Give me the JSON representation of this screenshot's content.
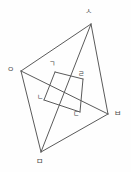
{
  "figure": {
    "type": "geometry-diagram",
    "background_color": "#fefefe",
    "line_color": "#5a5a5a",
    "label_color": "#4a4a4a",
    "vertices": [
      {
        "id": "s",
        "label": "ㅅ",
        "x": 91,
        "y": 24,
        "label_x": 85,
        "label_y": 8
      },
      {
        "id": "o",
        "label": "ㅇ",
        "x": 21,
        "y": 71,
        "label_x": 7,
        "label_y": 66
      },
      {
        "id": "b",
        "label": "ㅂ",
        "x": 108,
        "y": 114,
        "label_x": 114,
        "label_y": 110
      },
      {
        "id": "m",
        "label": "ㅁ",
        "x": 41,
        "y": 152,
        "label_x": 36,
        "label_y": 158
      }
    ],
    "section_points": [
      {
        "id": "g",
        "label": "ㄱ",
        "x": 55,
        "y": 72,
        "label_x": 49,
        "label_y": 61
      },
      {
        "id": "n",
        "label": "ㄴ",
        "x": 44,
        "y": 100,
        "label_x": 37,
        "label_y": 94
      },
      {
        "id": "d",
        "label": "ㄷ",
        "x": 80,
        "y": 112,
        "label_x": 73,
        "label_y": 111
      },
      {
        "id": "r",
        "label": "ㄹ",
        "x": 83,
        "y": 79,
        "label_x": 78,
        "label_y": 71
      }
    ],
    "edges": [
      {
        "name": "edge-o-s",
        "from": "o",
        "to": "s"
      },
      {
        "name": "edge-s-b",
        "from": "s",
        "to": "b"
      },
      {
        "name": "edge-o-m",
        "from": "o",
        "to": "m"
      },
      {
        "name": "edge-m-b",
        "from": "m",
        "to": "b"
      },
      {
        "name": "edge-s-m",
        "from": "s",
        "to": "m"
      },
      {
        "name": "edge-o-b",
        "from": "o",
        "to": "b"
      }
    ],
    "section_edges": [
      {
        "name": "section-edge-g-n",
        "from": "g",
        "to": "n"
      },
      {
        "name": "section-edge-n-d",
        "from": "n",
        "to": "d"
      },
      {
        "name": "section-edge-d-r",
        "from": "d",
        "to": "r"
      },
      {
        "name": "section-edge-r-g",
        "from": "r",
        "to": "g"
      }
    ]
  }
}
